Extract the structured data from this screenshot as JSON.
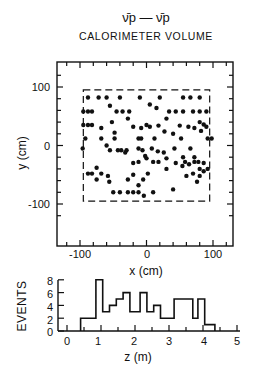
{
  "figure": {
    "title": "ν̄p — ν̄p",
    "subtitle": "CALORIMETER VOLUME"
  },
  "chart_data": [
    {
      "type": "scatter",
      "title": "CALORIMETER VOLUME",
      "xlabel": "x (cm)",
      "ylabel": "y (cm)",
      "xlim": [
        -130,
        130
      ],
      "ylim": [
        -140,
        140
      ],
      "xticks": [
        -100,
        0,
        100
      ],
      "yticks": [
        100,
        0,
        -100
      ],
      "fiducial_box": {
        "x": [
          -95,
          95
        ],
        "y": [
          -95,
          95
        ],
        "style": "dashed"
      },
      "grid": false,
      "points": [
        [
          -88,
          82
        ],
        [
          -72,
          82
        ],
        [
          -60,
          82
        ],
        [
          -40,
          82
        ],
        [
          -10,
          82
        ],
        [
          20,
          82
        ],
        [
          55,
          82
        ],
        [
          66,
          82
        ],
        [
          80,
          82
        ],
        [
          -95,
          58
        ],
        [
          -88,
          58
        ],
        [
          -82,
          58
        ],
        [
          -55,
          68
        ],
        [
          -45,
          58
        ],
        [
          -36,
          58
        ],
        [
          -26,
          58
        ],
        [
          5,
          70
        ],
        [
          15,
          64
        ],
        [
          34,
          58
        ],
        [
          44,
          58
        ],
        [
          55,
          58
        ],
        [
          70,
          58
        ],
        [
          80,
          58
        ],
        [
          90,
          58
        ],
        [
          -95,
          35
        ],
        [
          -88,
          35
        ],
        [
          -82,
          35
        ],
        [
          -68,
          30
        ],
        [
          -52,
          40
        ],
        [
          -28,
          46
        ],
        [
          -20,
          32
        ],
        [
          -8,
          30
        ],
        [
          0,
          35
        ],
        [
          5,
          32
        ],
        [
          18,
          34
        ],
        [
          30,
          46
        ],
        [
          50,
          34
        ],
        [
          63,
          32
        ],
        [
          72,
          30
        ],
        [
          80,
          40
        ],
        [
          86,
          36
        ],
        [
          90,
          32
        ],
        [
          -92,
          12
        ],
        [
          -68,
          12
        ],
        [
          -48,
          22
        ],
        [
          -48,
          12
        ],
        [
          -12,
          12
        ],
        [
          -8,
          12
        ],
        [
          12,
          12
        ],
        [
          27,
          24
        ],
        [
          40,
          20
        ],
        [
          52,
          12
        ],
        [
          82,
          25
        ],
        [
          92,
          12
        ],
        [
          98,
          12
        ],
        [
          -96,
          -5
        ],
        [
          -60,
          0
        ],
        [
          -55,
          -8
        ],
        [
          -43,
          -8
        ],
        [
          -38,
          -8
        ],
        [
          -30,
          -8
        ],
        [
          -12,
          -5
        ],
        [
          -6,
          -8
        ],
        [
          -2,
          -18
        ],
        [
          8,
          -5
        ],
        [
          17,
          -10
        ],
        [
          26,
          -12
        ],
        [
          42,
          -5
        ],
        [
          55,
          -20
        ],
        [
          66,
          -5
        ],
        [
          72,
          -20
        ],
        [
          -20,
          -30
        ],
        [
          -12,
          -28
        ],
        [
          0,
          -22
        ],
        [
          10,
          -28
        ],
        [
          18,
          -28
        ],
        [
          30,
          -22
        ],
        [
          44,
          -30
        ],
        [
          54,
          -35
        ],
        [
          58,
          -28
        ],
        [
          64,
          -32
        ],
        [
          72,
          -28
        ],
        [
          78,
          -28
        ],
        [
          80,
          -40
        ],
        [
          86,
          -30
        ],
        [
          -88,
          -48
        ],
        [
          -82,
          -48
        ],
        [
          -75,
          -38
        ],
        [
          -75,
          -58
        ],
        [
          -68,
          -48
        ],
        [
          -58,
          -52
        ],
        [
          -28,
          -58
        ],
        [
          -20,
          -50
        ],
        [
          -12,
          -68
        ],
        [
          -5,
          -58
        ],
        [
          2,
          -48
        ],
        [
          -32,
          -12
        ],
        [
          30,
          -40
        ],
        [
          60,
          -52
        ],
        [
          80,
          -52
        ],
        [
          86,
          -44
        ],
        [
          92,
          -40
        ],
        [
          -40,
          -80
        ],
        [
          -28,
          -80
        ],
        [
          -20,
          -80
        ],
        [
          -12,
          -80
        ],
        [
          -4,
          -86
        ],
        [
          10,
          -80
        ],
        [
          -56,
          -62
        ],
        [
          -50,
          -80
        ],
        [
          40,
          -75
        ],
        [
          70,
          -48
        ],
        [
          76,
          -62
        ]
      ]
    },
    {
      "type": "bar",
      "subtype": "step-histogram",
      "xlabel": "z (m)",
      "ylabel": "EVENTS",
      "xlim": [
        0,
        5
      ],
      "ylim": [
        0,
        8
      ],
      "xticks": [
        0,
        1,
        2,
        3,
        4,
        5
      ],
      "yticks": [
        0,
        2,
        4,
        6,
        8
      ],
      "bin_edges": [
        0.4,
        0.85,
        1.05,
        1.25,
        1.45,
        1.65,
        1.85,
        2.15,
        2.35,
        2.55,
        2.75,
        3.15,
        3.7,
        3.85,
        4.05,
        4.35
      ],
      "values": [
        2,
        8,
        3,
        4,
        5,
        6,
        3,
        6,
        3,
        4,
        2,
        5,
        2,
        5,
        1
      ]
    }
  ],
  "labels": {
    "scatter_x_ticks": [
      "-100",
      "0",
      "100"
    ],
    "scatter_y_ticks": [
      "100",
      "0",
      "-100"
    ],
    "scatter_xlabel": "x (cm)",
    "scatter_ylabel": "y (cm)",
    "hist_x_ticks": [
      "0",
      "1",
      "2",
      "3",
      "4",
      "5"
    ],
    "hist_y_ticks": [
      "8",
      "6",
      "4",
      "2",
      "0"
    ],
    "hist_xlabel": "z (m)",
    "hist_ylabel": "EVENTS"
  }
}
